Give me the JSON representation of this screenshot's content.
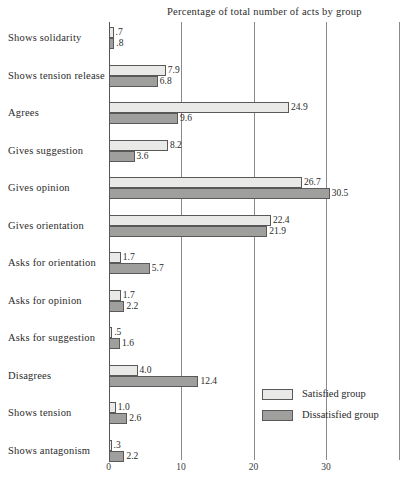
{
  "chart_data": {
    "type": "bar",
    "title": "Percentage of total number of acts by group",
    "orientation": "horizontal",
    "xlabel": "",
    "ylabel": "",
    "xlim": [
      0,
      40
    ],
    "xticks": [
      "0",
      "10",
      "20",
      "30"
    ],
    "xtick_values": [
      0,
      10,
      20,
      30
    ],
    "grid": true,
    "grid_axis": "x",
    "legend_position": "bottom-right",
    "categories": [
      "Shows solidarity",
      "Shows tension release",
      "Agrees",
      "Gives suggestion",
      "Gives opinion",
      "Gives orientation",
      "Asks for orientation",
      "Asks for opinion",
      "Asks for suggestion",
      "Disagrees",
      "Shows tension",
      "Shows antagonism"
    ],
    "series": [
      {
        "name": "Satisfied group",
        "color": "#e9e9e7",
        "values": [
          0.7,
          7.9,
          24.9,
          8.2,
          26.7,
          22.4,
          1.7,
          1.7,
          0.5,
          4.0,
          1.0,
          0.3
        ],
        "labels": [
          ".7",
          "7.9",
          "24.9",
          "8.2",
          "26.7",
          "22.4",
          "1.7",
          "1.7",
          ".5",
          "4.0",
          "1.0",
          ".3"
        ]
      },
      {
        "name": "Dissatisfied group",
        "color": "#9f9f9d",
        "values": [
          0.8,
          6.8,
          9.6,
          3.6,
          30.5,
          21.9,
          5.7,
          2.2,
          1.6,
          12.4,
          2.6,
          2.2
        ],
        "labels": [
          ".8",
          "6.8",
          "9.6",
          "3.6",
          "30.5",
          "21.9",
          "5.7",
          "2.2",
          "1.6",
          "12.4",
          "2.6",
          "2.2"
        ]
      }
    ]
  },
  "legend": {
    "items": [
      {
        "label": "Satisfied group",
        "swatch": "satisfied"
      },
      {
        "label": "Dissatisfied group",
        "swatch": "dissatisfied"
      }
    ]
  }
}
